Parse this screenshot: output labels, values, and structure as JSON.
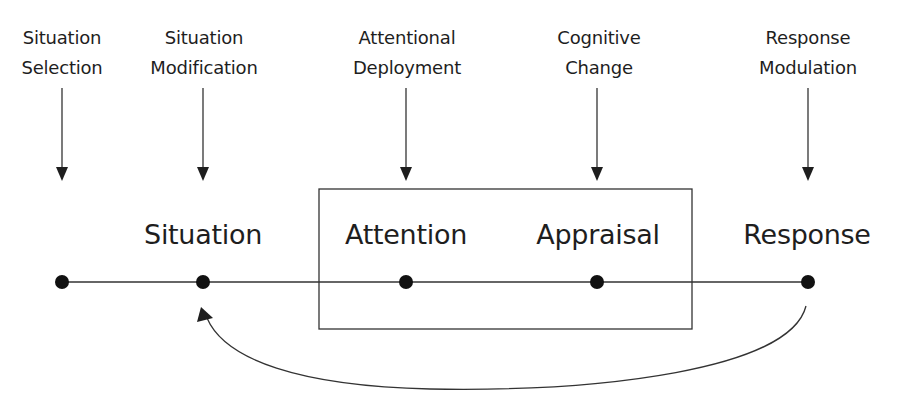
{
  "diagram": {
    "type": "process-model",
    "strategies": [
      {
        "id": "situation-selection",
        "line1": "Situation",
        "line2": "Selection",
        "x": 62
      },
      {
        "id": "situation-modification",
        "line1": "Situation",
        "line2": "Modification",
        "x": 203
      },
      {
        "id": "attentional-deployment",
        "line1": "Attentional",
        "line2": "Deployment",
        "x": 406
      },
      {
        "id": "cognitive-change",
        "line1": "Cognitive",
        "line2": "Change",
        "x": 597
      },
      {
        "id": "response-modulation",
        "line1": "Response",
        "line2": "Modulation",
        "x": 808
      }
    ],
    "stages": [
      {
        "id": "situation",
        "label": "Situation",
        "x": 203
      },
      {
        "id": "attention",
        "label": "Attention",
        "x": 406
      },
      {
        "id": "appraisal",
        "label": "Appraisal",
        "x": 597
      },
      {
        "id": "response",
        "label": "Response",
        "x": 808
      }
    ],
    "timeline": {
      "y": 282,
      "x_start": 62,
      "x_end": 808,
      "nodes_x": [
        62,
        203,
        406,
        597,
        808
      ]
    },
    "box": {
      "encloses": [
        "attention",
        "appraisal"
      ],
      "x": 319,
      "y": 189,
      "width": 373,
      "height": 140
    },
    "feedback_arrow": {
      "from": "response",
      "to": "situation"
    },
    "colors": {
      "ink": "#1e1e1e",
      "line": "#333333",
      "background": "#ffffff"
    }
  }
}
